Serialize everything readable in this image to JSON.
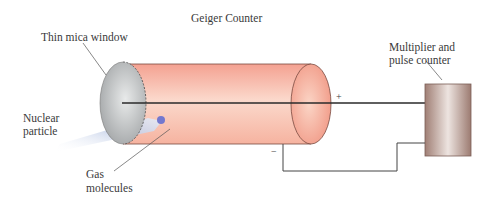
{
  "title": "Geiger Counter",
  "labels": {
    "window": "Thin mica window",
    "counter_line1": "Multiplier and",
    "counter_line2": "pulse counter",
    "particle_line1": "Nuclear",
    "particle_line2": "particle",
    "gas_line1": "Gas",
    "gas_line2": "molecules",
    "plus": "+",
    "minus": "−"
  },
  "colors": {
    "tube": "#f3a493",
    "tube_light": "#fbe0d6",
    "window": "#b9bcbe",
    "counter_box": "#a98a80",
    "wire": "#333333",
    "particle_beam": "#c8d3ea",
    "molecule": "#7b7fd0"
  }
}
